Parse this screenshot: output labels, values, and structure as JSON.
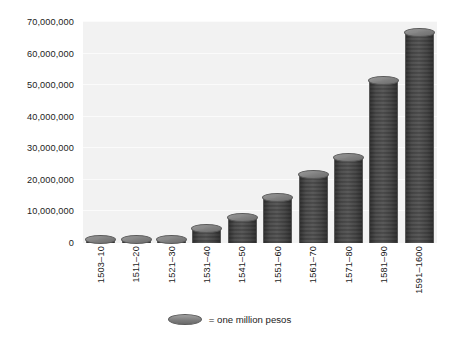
{
  "chart_data": {
    "type": "bar",
    "title": "",
    "subtitle": "",
    "xlabel": "",
    "ylabel": "",
    "grid": true,
    "legend_position": "bottom-center",
    "ylim": [
      0,
      70000000
    ],
    "ytick_labels": [
      "0",
      "10,000,000",
      "20,000,000",
      "30,000,000",
      "40,000,000",
      "50,000,000",
      "60,000,000",
      "70,000,000"
    ],
    "ytick_values": [
      0,
      10000000,
      20000000,
      30000000,
      40000000,
      50000000,
      60000000,
      70000000
    ],
    "categories": [
      "1503–10",
      "1511–20",
      "1521–30",
      "1531–40",
      "1541–50",
      "1551–60",
      "1561–70",
      "1571–80",
      "1581–90",
      "1591–1600"
    ],
    "values": [
      2500000,
      2500000,
      2000000,
      6000000,
      9500000,
      16000000,
      23000000,
      28500000,
      53000000,
      68000000
    ],
    "unit": "pesos",
    "legend": [
      {
        "marker": "coin-icon",
        "label": "= one million pesos"
      }
    ],
    "annotations": []
  },
  "colors": {
    "coin_face": "#8a8a8a",
    "coin_edge": "#5a5a5a",
    "plot_background": "#f2f2f2",
    "gridline": "#fbfbfb",
    "text": "#1c1c1c",
    "page_background": "#ffffff"
  }
}
